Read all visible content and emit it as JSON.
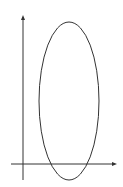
{
  "diagram": {
    "axes": {
      "origin": {
        "x": 23,
        "y": 164
      },
      "x_axis": {
        "x1": 11,
        "y": 164,
        "x2": 117,
        "arrow": "right"
      },
      "y_axis": {
        "x": 23,
        "y1": 180,
        "y2": 15,
        "arrow": "up"
      },
      "color": "#333333"
    },
    "ellipse": {
      "cx": 69,
      "cy": 101,
      "rx": 30,
      "ry": 79,
      "stroke": "#333333",
      "fill": "none"
    }
  }
}
